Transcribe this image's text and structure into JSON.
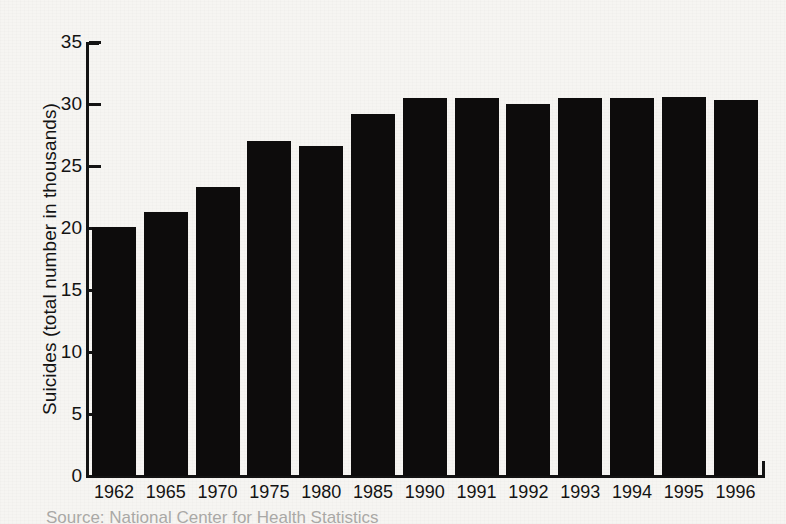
{
  "figure": {
    "background_color": "#f6f5f2",
    "ink_color": "#131313",
    "bar_color": "#0d0c0c",
    "source_note": "Source: National Center for Health Statistics"
  },
  "axes": {
    "y_title": "Suicides (total number in thousands)",
    "y_ticks": [
      "35",
      "30",
      "25",
      "20",
      "15",
      "10",
      "5",
      "0"
    ],
    "x_ticks": [
      "1962",
      "1965",
      "1970",
      "1975",
      "1980",
      "1985",
      "1990",
      "1991",
      "1992",
      "1993",
      "1994",
      "1995",
      "1996"
    ]
  },
  "chart_data": {
    "type": "bar",
    "title": "",
    "subtitle": "",
    "xlabel": "",
    "ylabel": "Suicides (total number in thousands)",
    "categories": [
      "1962",
      "1965",
      "1970",
      "1975",
      "1980",
      "1985",
      "1990",
      "1991",
      "1992",
      "1993",
      "1994",
      "1995",
      "1996"
    ],
    "values": [
      20.1,
      21.3,
      23.3,
      27.0,
      26.6,
      29.2,
      30.5,
      30.5,
      30.0,
      30.5,
      30.5,
      30.6,
      30.3
    ],
    "ylim": [
      0,
      35
    ],
    "ytick_step": 5,
    "grid": false,
    "legend": null,
    "bar_color": "#0d0c0c",
    "units": "thousands"
  }
}
